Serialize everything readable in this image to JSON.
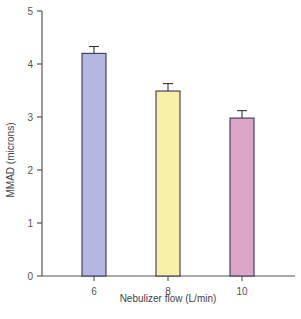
{
  "chart_data": {
    "type": "bar",
    "title": "",
    "xlabel": "Nebulizer flow (L/min)",
    "ylabel": "MMAD (microns)",
    "categories": [
      "6",
      "8",
      "10"
    ],
    "values": [
      4.2,
      3.49,
      2.98
    ],
    "error_upper": [
      0.13,
      0.14,
      0.14
    ],
    "colors": [
      "#b4b6e4",
      "#f6f1a6",
      "#dba6c9"
    ],
    "ylim": [
      0,
      5
    ],
    "yticks": [
      "0",
      "1",
      "2",
      "3",
      "4",
      "5"
    ],
    "grid": false,
    "legend": null
  }
}
